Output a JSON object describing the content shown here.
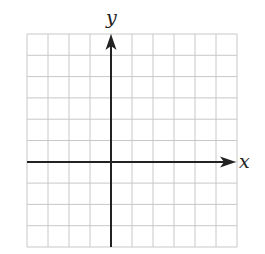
{
  "diagram": {
    "type": "coordinate-grid",
    "x_axis_label": "x",
    "y_axis_label": "y",
    "grid": {
      "columns": 10,
      "rows": 10,
      "columns_left_of_y_axis": 4,
      "columns_right_of_y_axis": 6,
      "rows_above_x_axis": 6,
      "rows_below_x_axis": 4
    },
    "colors": {
      "grid": "#c8c8c8",
      "axes": "#222222",
      "background": "#ffffff"
    }
  }
}
